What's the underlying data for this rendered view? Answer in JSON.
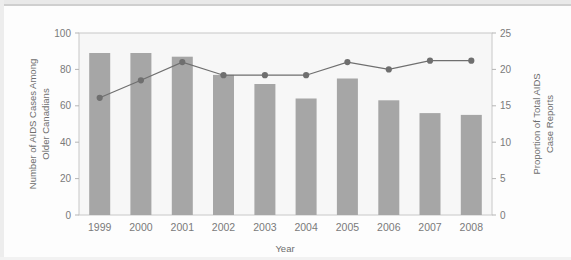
{
  "chart_data": {
    "type": "bar",
    "title": "",
    "subtitle": "",
    "xlabel": "Year",
    "categories": [
      "1999",
      "2000",
      "2001",
      "2002",
      "2003",
      "2004",
      "2005",
      "2006",
      "2007",
      "2008"
    ],
    "series": [
      {
        "name": "Number of AIDS Cases Among Older Canadians",
        "type": "bar",
        "axis": "left",
        "values": [
          89,
          89,
          87,
          77,
          72,
          64,
          75,
          63,
          56,
          55
        ],
        "color": "#a6a6a6"
      },
      {
        "name": "Proportion of Total AIDS Case Reports",
        "type": "line",
        "axis": "right",
        "values": [
          16.1,
          18.5,
          21.0,
          19.2,
          19.2,
          19.2,
          21.0,
          20.0,
          21.2,
          21.2
        ],
        "color": "#6f6f6f"
      }
    ],
    "left_axis": {
      "label_line1": "Number of AIDS Cases Among",
      "label_line2": "Older Canadians",
      "ticks": [
        "0",
        "20",
        "40",
        "60",
        "80",
        "100"
      ],
      "tick_values": [
        0,
        20,
        40,
        60,
        80,
        100
      ],
      "ylim": [
        0,
        100
      ]
    },
    "right_axis": {
      "label_line1": "Proportion of Total AIDS",
      "label_line2": "Case Reports",
      "ticks": [
        "0",
        "5",
        "10",
        "15",
        "20",
        "25"
      ],
      "tick_values": [
        0,
        5,
        10,
        15,
        20,
        25
      ],
      "ylim": [
        0,
        25
      ]
    },
    "grid": false,
    "legend": "none",
    "plot_background": "#f7f7f7",
    "frame_color": "#c8c8c8"
  }
}
